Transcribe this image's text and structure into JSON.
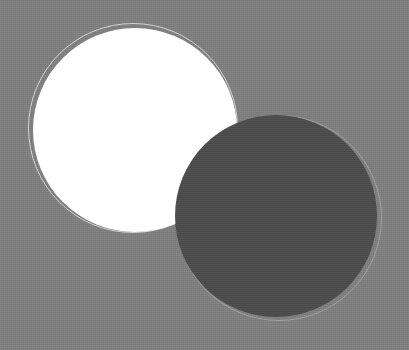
{
  "scene": {
    "width": 409,
    "height": 350,
    "background_color": "#7f7f7f",
    "shapes": [
      {
        "name": "white-circle",
        "fill": "#ffffff",
        "cx": 135,
        "cy": 130,
        "r": 102,
        "outline_ring": {
          "cx": 133,
          "cy": 128,
          "r": 105,
          "color": "#d2d2d2"
        }
      },
      {
        "name": "dark-circle",
        "fill": "#4b4b4b",
        "cx": 276,
        "cy": 216,
        "r": 101,
        "outline_ring": {
          "cx": 279,
          "cy": 218,
          "r": 103,
          "color": "#a0a0a0"
        }
      }
    ]
  }
}
